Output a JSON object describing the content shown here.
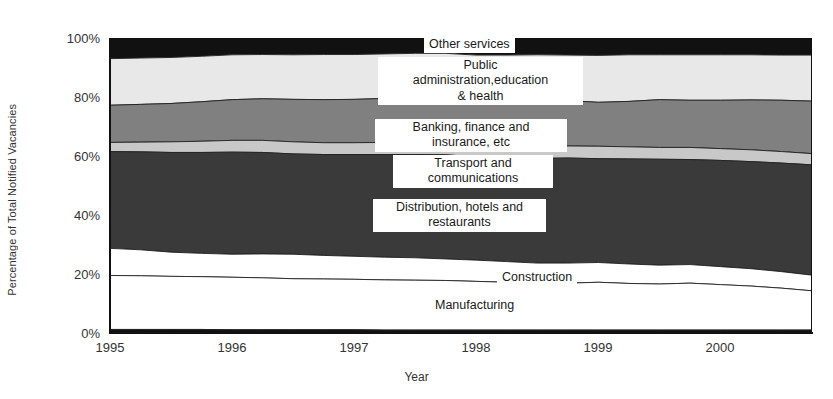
{
  "chart_data": {
    "type": "area",
    "title": "",
    "subtitle": "",
    "xlabel": "Year",
    "ylabel": "Percentage of Total Notified Vacancies",
    "stacked": true,
    "normalized": "100%",
    "grid": false,
    "legend_position": "inline-annotations",
    "xlim": [
      1995.0,
      2000.75
    ],
    "ylim": [
      0,
      100
    ],
    "ytick_labels": [
      "0%",
      "20%",
      "40%",
      "60%",
      "80%",
      "100%"
    ],
    "ytick_values": [
      0,
      20,
      40,
      60,
      80,
      100
    ],
    "xtick_labels": [
      "1995",
      "1996",
      "1997",
      "1998",
      "1999",
      "2000"
    ],
    "xtick_values": [
      1995,
      1996,
      1997,
      1998,
      1999,
      2000
    ],
    "x": [
      1995.0,
      1995.25,
      1995.5,
      1995.75,
      1996.0,
      1996.25,
      1996.5,
      1996.75,
      1997.0,
      1997.25,
      1997.5,
      1997.75,
      1998.0,
      1998.25,
      1998.5,
      1998.75,
      1999.0,
      1999.25,
      1999.5,
      1999.75,
      2000.0,
      2000.25,
      2000.5,
      2000.75
    ],
    "series": [
      {
        "name": "Other (unlabelled base band)",
        "color": "#111111",
        "values": [
          1.2,
          1.2,
          1.2,
          1.2,
          1.1,
          1.1,
          1.1,
          1.1,
          1.1,
          1.0,
          1.0,
          1.0,
          1.0,
          1.0,
          1.0,
          1.0,
          1.0,
          1.0,
          1.0,
          1.0,
          1.0,
          1.0,
          1.0,
          1.0
        ]
      },
      {
        "name": "Manufacturing",
        "color": "#ffffff",
        "values": [
          18.3,
          18.2,
          18.0,
          17.9,
          17.8,
          17.6,
          17.3,
          17.2,
          17.1,
          17.0,
          16.9,
          16.8,
          16.5,
          16.2,
          15.8,
          15.9,
          16.2,
          15.8,
          15.6,
          15.9,
          15.4,
          14.9,
          14.2,
          13.3
        ]
      },
      {
        "name": "Construction",
        "color": "#ffffff",
        "values": [
          9.2,
          8.8,
          8.2,
          7.9,
          7.8,
          8.1,
          8.3,
          8.0,
          7.8,
          7.7,
          7.6,
          7.3,
          7.2,
          7.0,
          6.9,
          6.8,
          6.7,
          6.6,
          6.4,
          6.3,
          6.1,
          5.9,
          5.6,
          5.3
        ]
      },
      {
        "name": "Distribution, hotels and restaurants",
        "color": "#3a3a3a",
        "values": [
          32.8,
          33.2,
          33.8,
          34.2,
          34.6,
          34.4,
          34.0,
          34.2,
          34.5,
          34.8,
          35.0,
          35.3,
          35.0,
          35.2,
          35.5,
          35.6,
          35.2,
          35.6,
          35.9,
          35.6,
          36.0,
          36.3,
          36.8,
          37.4
        ]
      },
      {
        "name": "Transport and communications",
        "color": "#c8c8c8",
        "values": [
          3.1,
          3.3,
          3.6,
          3.8,
          4.0,
          4.1,
          4.1,
          4.0,
          4.0,
          4.1,
          4.1,
          4.2,
          4.2,
          4.1,
          4.0,
          4.1,
          4.2,
          4.1,
          4.0,
          4.1,
          4.0,
          4.0,
          3.9,
          3.8
        ]
      },
      {
        "name": "Banking, finance and insurance, etc",
        "color": "#808080",
        "values": [
          12.6,
          12.8,
          13.0,
          13.4,
          13.8,
          14.1,
          14.4,
          14.6,
          14.7,
          14.9,
          15.2,
          15.3,
          15.2,
          15.4,
          15.6,
          15.4,
          14.9,
          15.4,
          16.2,
          16.0,
          16.4,
          16.9,
          17.4,
          17.8
        ]
      },
      {
        "name": "Public administration,education & health",
        "color": "#e8e8e8",
        "values": [
          15.8,
          15.7,
          15.6,
          15.4,
          15.2,
          15.0,
          15.1,
          15.3,
          15.2,
          15.1,
          15.0,
          14.9,
          15.1,
          15.3,
          15.5,
          15.4,
          15.9,
          15.8,
          15.2,
          15.4,
          15.4,
          15.3,
          15.3,
          15.6
        ]
      },
      {
        "name": "Other services",
        "color": "#111111",
        "values": [
          7.0,
          6.8,
          6.6,
          6.2,
          5.7,
          5.6,
          5.7,
          5.6,
          5.6,
          5.4,
          5.2,
          5.2,
          5.8,
          5.8,
          5.7,
          5.8,
          5.9,
          5.7,
          5.7,
          5.7,
          5.7,
          5.7,
          5.8,
          5.8
        ]
      }
    ],
    "annotations": [
      {
        "text": "Other services",
        "series": "Other services"
      },
      {
        "text": "Public\nadministration,education\n& health",
        "series": "Public administration,education & health"
      },
      {
        "text": "Banking, finance and\ninsurance, etc",
        "series": "Banking, finance and insurance, etc"
      },
      {
        "text": "Transport and\ncommunications",
        "series": "Transport and communications"
      },
      {
        "text": "Distribution, hotels and\nrestaurants",
        "series": "Distribution, hotels and restaurants"
      },
      {
        "text": "Construction",
        "series": "Construction"
      },
      {
        "text": "Manufacturing",
        "series": "Manufacturing"
      }
    ]
  },
  "axis": {
    "y_title": "Percentage of Total Notified Vacancies",
    "x_title": "Year",
    "yticks": [
      "100%",
      "80%",
      "60%",
      "40%",
      "20%",
      "0%"
    ],
    "xticks": [
      "1995",
      "1996",
      "1997",
      "1998",
      "1999",
      "2000"
    ]
  },
  "labels": {
    "other_services": "Other services",
    "public_admin": "Public\nadministration,education\n& health",
    "banking": "Banking, finance and\ninsurance, etc",
    "transport": "Transport and\ncommunications",
    "distribution": "Distribution, hotels and\nrestaurants",
    "construction": "Construction",
    "manufacturing": "Manufacturing"
  }
}
